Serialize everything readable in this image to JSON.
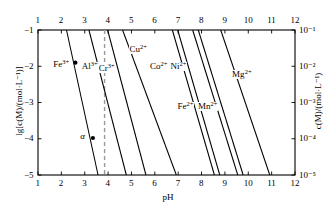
{
  "chart_data": {
    "type": "line",
    "title": "",
    "xlabel": "pH",
    "ylabel": "lg[c(M)/(mol·L⁻¹)]",
    "y2label": "c(M)/(mol·L⁻¹)",
    "xlim": [
      1,
      12
    ],
    "ylim": [
      -5,
      -1
    ],
    "grid": false,
    "legend": "inline-curve-labels",
    "x_ticks": [
      1,
      2,
      3,
      4,
      5,
      6,
      7,
      8,
      9,
      10,
      11,
      12
    ],
    "x_tick_labels": [
      "1",
      "2",
      "3",
      "4",
      "5",
      "6",
      "7",
      "8",
      "9",
      "10",
      "11",
      "12"
    ],
    "x_ticks_top": [
      1,
      2,
      3,
      4,
      5,
      6,
      7,
      8,
      9,
      10,
      11,
      12
    ],
    "x_tick_labels_top": [
      "1",
      "2",
      "3",
      "4",
      "5",
      "6",
      "7",
      "8",
      "9",
      "10",
      "11",
      "12"
    ],
    "y_ticks": [
      -1,
      -2,
      -3,
      -4,
      -5
    ],
    "y_tick_labels": [
      "−1",
      "−2",
      "−3",
      "−4",
      "−5"
    ],
    "y2_ticks": [
      -1,
      -2,
      -3,
      -4,
      -5
    ],
    "y2_tick_labels": [
      "10⁻¹",
      "10⁻²",
      "10⁻³",
      "10⁻⁴",
      "10⁻⁵"
    ],
    "series": [
      {
        "name": "Fe3+",
        "label": "Fe",
        "charge": "3+",
        "x_at_ymax": 2.22,
        "x_at_ymin": 3.57,
        "label_x": 2.0,
        "label_y": -1.95
      },
      {
        "name": "Al3+",
        "label": "Al",
        "charge": "3+",
        "x_at_ymax": 3.18,
        "x_at_ymin": 4.78,
        "label_x": 3.22,
        "label_y": -2.02
      },
      {
        "name": "Cr3+",
        "label": "Cr",
        "charge": "3+",
        "x_at_ymax": 3.98,
        "x_at_ymin": 5.62,
        "label_x": 3.95,
        "label_y": -2.05
      },
      {
        "name": "Cu2+",
        "label": "Cu",
        "charge": "2+",
        "x_at_ymax": 4.62,
        "x_at_ymin": 6.92,
        "label_x": 5.28,
        "label_y": -1.55
      },
      {
        "name": "Co2+",
        "label": "Co",
        "charge": "2+",
        "x_at_ymax": 6.75,
        "x_at_ymin": 8.55,
        "label_x": 6.16,
        "label_y": -2.02
      },
      {
        "name": "Ni2+",
        "label": "Ni",
        "charge": "2+",
        "x_at_ymax": 6.98,
        "x_at_ymin": 8.78,
        "label_x": 7.02,
        "label_y": -2.02
      },
      {
        "name": "Fe2+",
        "label": "Fe",
        "charge": "2+",
        "x_at_ymax": 7.62,
        "x_at_ymin": 9.55,
        "label_x": 7.32,
        "label_y": -3.12
      },
      {
        "name": "Mn2+",
        "label": "Mn",
        "charge": "2+",
        "x_at_ymax": 7.86,
        "x_at_ymin": 9.78,
        "label_x": 8.26,
        "label_y": -3.1
      },
      {
        "name": "Mg2+",
        "label": "Mg",
        "charge": "2+",
        "x_at_ymax": 8.82,
        "x_at_ymin": 10.92,
        "label_x": 9.72,
        "label_y": -2.22
      }
    ],
    "reference_line": {
      "orientation": "vertical",
      "x": 3.85,
      "style": "dashed",
      "color": "#999999"
    },
    "markers": [
      {
        "label": "",
        "x": 2.6,
        "y": -1.9,
        "on_series": "Fe3+"
      },
      {
        "label": "α",
        "x": 3.35,
        "y": -3.98,
        "on_series": "Fe3+",
        "label_x": 2.92,
        "label_y": -3.95
      }
    ]
  }
}
